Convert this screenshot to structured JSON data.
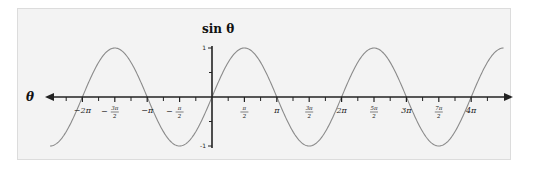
{
  "chart_data": {
    "type": "line",
    "title": "",
    "xlabel": "θ",
    "ylabel": "sin θ",
    "function": "sin(θ)",
    "xlim_radians": [
      -7.854,
      14.137
    ],
    "ylim": [
      -1,
      1
    ],
    "grid": false,
    "legend": null,
    "x_tick_labels": [
      "−2π",
      "−3π/2",
      "−π",
      "−π/2",
      "π/2",
      "π",
      "3π/2",
      "2π",
      "5π/2",
      "3π",
      "7π/2",
      "4π"
    ],
    "x_tick_values_in_pi": [
      -2,
      -1.5,
      -1,
      -0.5,
      0.5,
      1,
      1.5,
      2,
      2.5,
      3,
      3.5,
      4
    ],
    "y_tick_labels": [
      "1",
      "-1"
    ],
    "y_tick_values": [
      1,
      -1
    ],
    "series": [
      {
        "name": "sin θ",
        "x_in_pi": [
          -2.5,
          -2,
          -1.5,
          -1,
          -0.5,
          0,
          0.5,
          1,
          1.5,
          2,
          2.5,
          3,
          3.5,
          4,
          4.5
        ],
        "y": [
          -1,
          0,
          1,
          0,
          -1,
          0,
          1,
          0,
          -1,
          0,
          1,
          0,
          -1,
          0,
          1
        ]
      }
    ],
    "colors": {
      "curve": "#8a8a8a",
      "axes": "#222222",
      "background": "#f3f3f3"
    }
  }
}
